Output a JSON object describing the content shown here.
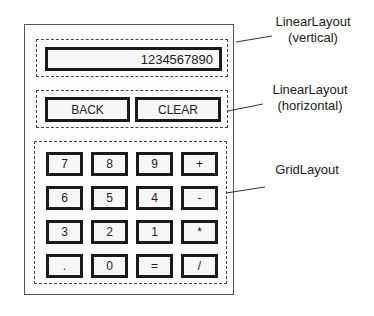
{
  "display": {
    "value": "1234567890"
  },
  "controls": {
    "back_label": "BACK",
    "clear_label": "CLEAR"
  },
  "keypad": {
    "keys": [
      "7",
      "8",
      "9",
      "+",
      "6",
      "5",
      "4",
      "-",
      "3",
      "2",
      "1",
      "*",
      ".",
      "0",
      "=",
      "/"
    ]
  },
  "annotations": {
    "vertical": {
      "line1": "LinearLayout",
      "line2": "(vertical)"
    },
    "horizontal": {
      "line1": "LinearLayout",
      "line2": "(horizontal)"
    },
    "grid": {
      "line1": "GridLayout"
    }
  }
}
